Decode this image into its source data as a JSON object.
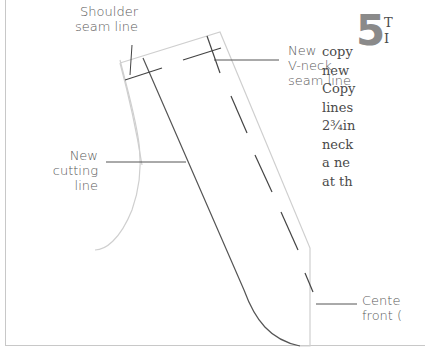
{
  "diagram": {
    "type": "sewing-pattern-instruction",
    "labels": {
      "shoulder_seam": [
        "Shoulder",
        "seam line"
      ],
      "new_vneck": [
        "New",
        "V-neck",
        "seam line"
      ],
      "new_cutting": [
        "New",
        "cutting",
        "line"
      ],
      "center_front": [
        "Cente",
        "front ("
      ]
    },
    "step": {
      "number": "5",
      "first_line": "T",
      "first_line_2": "I",
      "lines": [
        "copy",
        "new",
        "Copy",
        "lines",
        "2¾in",
        "neck",
        "a ne",
        "at th"
      ]
    },
    "colors": {
      "outline": "#c9c9c9",
      "line": "#555555",
      "label_text": "#5a5a5a",
      "step_number": "#8a8a8a"
    }
  }
}
